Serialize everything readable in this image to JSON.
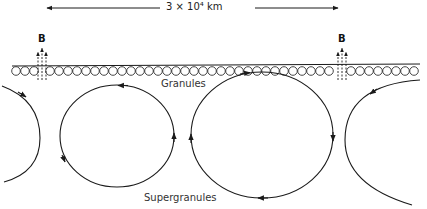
{
  "diagram": {
    "scale_bar": {
      "label": "3 × 10⁴ km",
      "x1": 45,
      "x2": 340,
      "y": 8
    },
    "magnetic_field": [
      {
        "label": "B",
        "x": 42
      },
      {
        "label": "B",
        "x": 342
      }
    ],
    "granule_layer": {
      "label": "Granules",
      "circle_count": 44
    },
    "supergranule_layer": {
      "label": "Supergranules",
      "cells": 4
    },
    "colors": {
      "line": "#1a1a1a",
      "background": "#ffffff"
    }
  }
}
